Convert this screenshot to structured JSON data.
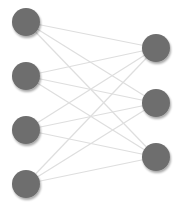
{
  "diagram": {
    "type": "bipartite-network",
    "colors": {
      "node_fill": "#6e6e6e",
      "node_shadow": "#d8d8d8",
      "edge": "#dedede",
      "background": "#ffffff"
    },
    "node_radius": 14,
    "left_nodes": [
      {
        "id": "L1",
        "x": 26,
        "y": 22
      },
      {
        "id": "L2",
        "x": 26,
        "y": 76
      },
      {
        "id": "L3",
        "x": 26,
        "y": 130
      },
      {
        "id": "L4",
        "x": 26,
        "y": 184
      }
    ],
    "right_nodes": [
      {
        "id": "R1",
        "x": 156,
        "y": 48
      },
      {
        "id": "R2",
        "x": 156,
        "y": 103
      },
      {
        "id": "R3",
        "x": 156,
        "y": 157
      }
    ],
    "edges": "fully-connected"
  }
}
